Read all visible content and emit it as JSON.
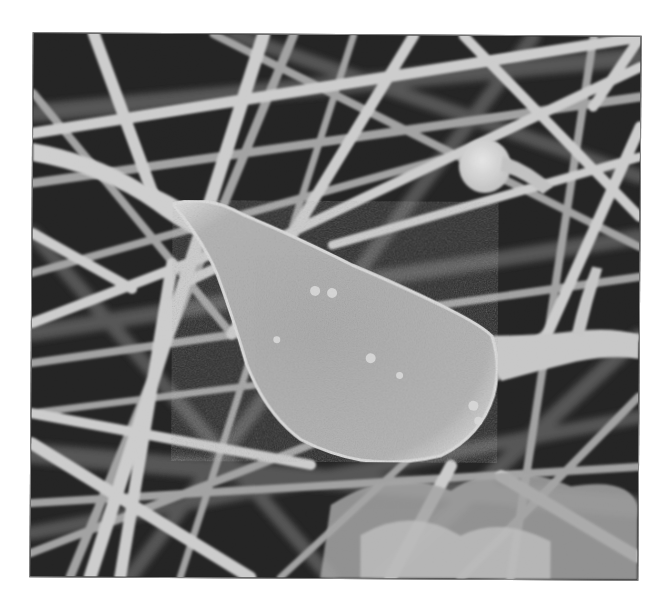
{
  "image": {
    "kind": "scanning-electron-micrograph",
    "colormode": "grayscale",
    "subject": "neuron cell body on fibrous nanofiber mesh",
    "frame": {
      "x": 31,
      "y": 34,
      "width": 607,
      "height": 543
    },
    "palette": {
      "background_dark": "#1c1c1c",
      "fiber_light": "#d2d2d2",
      "fiber_mid": "#a8a8a8",
      "cell_body": "#b9b9b9",
      "cell_edge": "#e6e6e6",
      "frame_border": "#8a8a8a"
    },
    "regions": [
      {
        "name": "cell-body",
        "description": "large teardrop-shaped soma centered slightly left of center"
      },
      {
        "name": "dendrite",
        "description": "process extending from soma toward upper-left corner"
      },
      {
        "name": "axon",
        "description": "process extending from soma to the right edge"
      },
      {
        "name": "round-blob",
        "description": "small bright spherical particle upper right"
      },
      {
        "name": "fiber-mesh",
        "description": "dense network of crossing cylindrical fibers filling the background"
      }
    ],
    "text": []
  }
}
